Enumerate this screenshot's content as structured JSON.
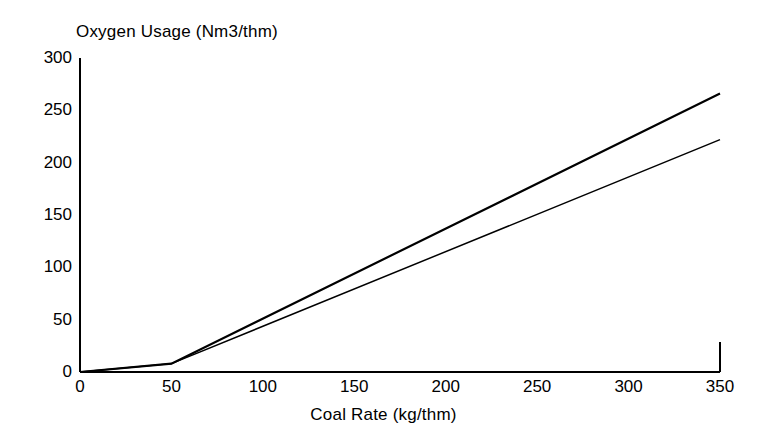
{
  "chart_data": {
    "type": "line",
    "title": "Oxygen Usage (Nm3/thm)",
    "xlabel": "Coal Rate (kg/thm)",
    "ylabel": "Oxygen Usage (Nm3/thm)",
    "xlim": [
      0,
      350
    ],
    "ylim": [
      0,
      300
    ],
    "xticks": [
      0,
      50,
      100,
      150,
      200,
      250,
      300,
      350
    ],
    "xtick_labels": [
      "0",
      "50",
      "100",
      "150",
      "200",
      "250",
      "300",
      "350"
    ],
    "yticks": [
      0,
      50,
      100,
      150,
      200,
      250,
      300
    ],
    "ytick_labels": [
      "0",
      "50",
      "100",
      "150",
      "200",
      "250",
      "300"
    ],
    "grid": false,
    "legend": false,
    "legend_position": "none",
    "line_color": "#000000",
    "background_color": "#ffffff",
    "x": [
      0,
      50,
      350
    ],
    "series": [
      {
        "name": "upper",
        "values": [
          0,
          8,
          266
        ],
        "points": [
          [
            0,
            0
          ],
          [
            50,
            8
          ],
          [
            350,
            266
          ]
        ]
      },
      {
        "name": "lower",
        "values": [
          0,
          8,
          222
        ],
        "points": [
          [
            0,
            0
          ],
          [
            50,
            8
          ],
          [
            350,
            222
          ]
        ]
      }
    ],
    "annotations": []
  },
  "axis_titles": {
    "top": "Oxygen Usage (Nm3/thm)",
    "bottom": "Coal Rate (kg/thm)"
  }
}
